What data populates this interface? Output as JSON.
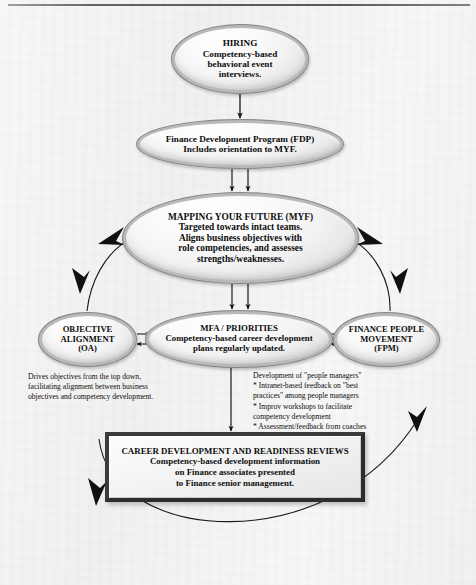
{
  "diagram": {
    "colors": {
      "page_background": "#efefef",
      "node_fill": "#f2f2f2",
      "node_border": "#b9b9b9",
      "text": "#0d0d0d",
      "connector": "#1a1a1a",
      "box_border": "#3b3b3b"
    },
    "nodes": {
      "hiring": {
        "shape": "ellipse",
        "heading": "HIRING",
        "body": "Competency-based\nbehavioral event\ninterviews."
      },
      "fdp": {
        "shape": "ellipse",
        "heading": "Finance Development Program (FDP)",
        "body": "Includes orientation to MYF."
      },
      "myf": {
        "shape": "ellipse",
        "heading": "MAPPING YOUR FUTURE (MYF)",
        "body": "Targeted towards intact teams.\nAligns business objectives with\nrole competencies, and assesses\nstrengths/weaknesses."
      },
      "oa": {
        "shape": "ellipse",
        "heading": "OBJECTIVE\nALIGNMENT\n(OA)",
        "body": ""
      },
      "mfa": {
        "shape": "ellipse",
        "heading": "MFA / PRIORITIES",
        "body": "Competency-based career development\nplans regularly updated."
      },
      "fpm": {
        "shape": "ellipse",
        "heading": "FINANCE PEOPLE\nMOVEMENT\n(FPM)",
        "body": ""
      },
      "career_reviews": {
        "shape": "rectangle",
        "heading": "CAREER DEVELOPMENT AND READINESS REVIEWS",
        "body": "Competency-based development information\non Finance associates presented\nto Finance senior management."
      }
    },
    "notes": {
      "oa_note": "Drives objectives from the top down,\nfacilitating alignment between business\nobjectives and competency development.",
      "fpm_note": "Development of \"people managers\"\n* Intranet-based feedback on \"best\n   practices\" among people managers\n* Improv workshops to facilitate\n   competency development\n* Assessment/feedback from coaches"
    }
  }
}
